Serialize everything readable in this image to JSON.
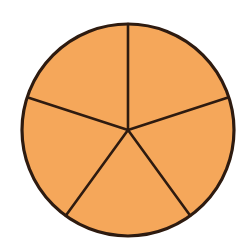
{
  "figure": {
    "kind": "fraction-circle",
    "shape": "circle",
    "total_parts": 5,
    "shaded_parts": 5,
    "fraction_label": "5/5",
    "background_color": "#ffffff"
  },
  "colors": {
    "fill": "#f5a75a",
    "outline": "#2e1b10",
    "spoke": "#2e1b10",
    "background": "#ffffff"
  },
  "geometry": {
    "center_x": 128,
    "center_y": 130,
    "radius": 106,
    "outline_width": 3.2,
    "spoke_width": 2.6,
    "start_angle_deg": -90,
    "sector_angle_deg": 72
  },
  "chart_data": {
    "type": "pie",
    "categories": [
      "Fifth 1",
      "Fifth 2",
      "Fifth 3",
      "Fifth 4",
      "Fifth 5"
    ],
    "values": [
      20,
      20,
      20,
      20,
      20
    ],
    "labels_shown": false,
    "legend": false,
    "legend_position": "none",
    "slice_colors": [
      "#f5a75a",
      "#f5a75a",
      "#f5a75a",
      "#f5a75a",
      "#f5a75a"
    ],
    "slice_start_angles_deg": [
      -90,
      -18,
      54,
      126,
      198
    ],
    "slice_sweep_deg": [
      72,
      72,
      72,
      72,
      72
    ],
    "xlabel": "",
    "ylabel": ""
  },
  "sectors": [
    {
      "name": "sector-1",
      "start_deg": -90,
      "end_deg": -18,
      "share": "1/5"
    },
    {
      "name": "sector-2",
      "start_deg": -18,
      "end_deg": 54,
      "share": "1/5"
    },
    {
      "name": "sector-3",
      "start_deg": 54,
      "end_deg": 126,
      "share": "1/5"
    },
    {
      "name": "sector-4",
      "start_deg": 126,
      "end_deg": 198,
      "share": "1/5"
    },
    {
      "name": "sector-5",
      "start_deg": 198,
      "end_deg": 270,
      "share": "1/5"
    }
  ]
}
